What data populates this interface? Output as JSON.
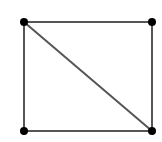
{
  "diagram": {
    "type": "graph",
    "background": "#ffffff",
    "edge_color": "#555555",
    "vertex_color": "#000000",
    "vertices": [
      {
        "id": "v1",
        "x": 24,
        "y": 22
      },
      {
        "id": "v2",
        "x": 152,
        "y": 22
      },
      {
        "id": "v3",
        "x": 24,
        "y": 131
      },
      {
        "id": "v4",
        "x": 152,
        "y": 131
      }
    ],
    "edges": [
      {
        "from": "v1",
        "to": "v2"
      },
      {
        "from": "v1",
        "to": "v3"
      },
      {
        "from": "v2",
        "to": "v4"
      },
      {
        "from": "v3",
        "to": "v4"
      },
      {
        "from": "v1",
        "to": "v4"
      }
    ]
  }
}
